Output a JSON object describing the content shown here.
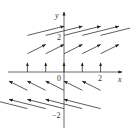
{
  "diagram": {
    "type": "vector-field",
    "axes": {
      "x_label": "x",
      "y_label": "y",
      "origin_label": "0",
      "x_ticks": [
        {
          "value": 2,
          "label": "2"
        }
      ],
      "y_ticks": [
        {
          "value": 2,
          "label": "2"
        },
        {
          "value": -2,
          "label": "−2"
        }
      ]
    },
    "grid_x": [
      -2,
      -1,
      0,
      1,
      2
    ],
    "grid_y": [
      -2,
      -1,
      0,
      1,
      2
    ],
    "vector_rule": "vector at (x,y) has components (y, 0.5)",
    "colors": {
      "stroke": "#333333",
      "background": "#ffffff"
    }
  }
}
